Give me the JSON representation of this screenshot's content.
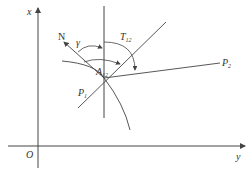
{
  "diagram": {
    "axes": {
      "x_label": "x",
      "y_label": "y",
      "origin_label": "O"
    },
    "north_label": "N",
    "angle_gamma_label": "γ",
    "bearing_label": {
      "main": "T",
      "sub": "12"
    },
    "point_A_label": {
      "main": "A",
      "sub": "12"
    },
    "point_P1_label": {
      "main": "P",
      "sub": "1"
    },
    "point_P2_label": {
      "main": "P",
      "sub": "2"
    },
    "colors": {
      "stroke": "#444444",
      "text": "#333333",
      "background": "#ffffff"
    }
  }
}
